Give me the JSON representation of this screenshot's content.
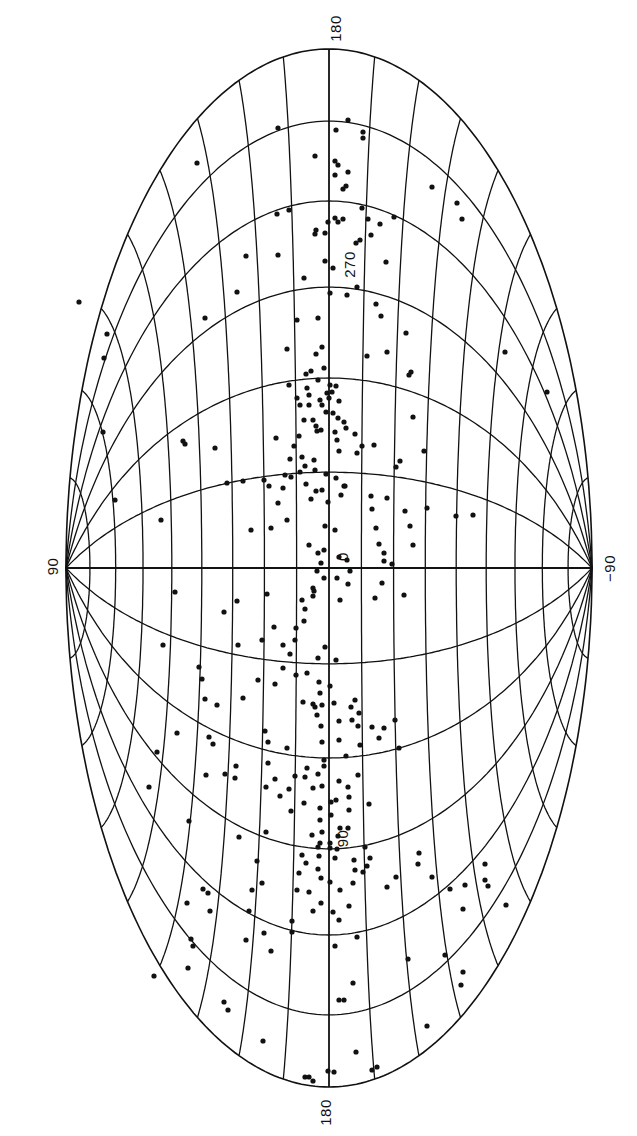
{
  "chart_data": {
    "type": "scatter",
    "title": "",
    "projection": "Hammer-Aitoff equal-area (galactic coordinates), rotated 90 degrees",
    "xlabel": "galactic latitude (horizontal: +90 at left pole, -90 at right pole)",
    "ylabel": "galactic longitude (vertical: 180 top, 270, 0 centre, 90, 180 bottom)",
    "grid": true,
    "grid_spacing": {
      "longitude_deg": 30,
      "latitude_deg": 10
    },
    "labels": {
      "top": "180",
      "bottom": "180",
      "left_pole": "90",
      "right_pole": "−90",
      "center": "0",
      "upper_meridian": "270",
      "lower_meridian": "90"
    },
    "geometry": {
      "cx": 329,
      "cy": 568,
      "half_width": 263,
      "half_height": 519
    },
    "points_screen_px": [
      [
        348,
        120
      ],
      [
        336,
        130
      ],
      [
        338,
        165
      ],
      [
        335,
        175
      ],
      [
        348,
        172
      ],
      [
        315,
        156
      ],
      [
        278,
        128
      ],
      [
        197,
        163
      ],
      [
        277,
        214
      ],
      [
        289,
        210
      ],
      [
        278,
        255
      ],
      [
        246,
        256
      ],
      [
        237,
        292
      ],
      [
        205,
        318
      ],
      [
        107,
        334
      ],
      [
        79,
        302
      ],
      [
        104,
        358
      ],
      [
        103,
        432
      ],
      [
        115,
        500
      ],
      [
        346,
        186
      ],
      [
        363,
        138
      ],
      [
        363,
        132
      ],
      [
        335,
        161
      ],
      [
        343,
        189
      ],
      [
        338,
        222
      ],
      [
        343,
        219
      ],
      [
        328,
        222
      ],
      [
        315,
        234
      ],
      [
        325,
        233
      ],
      [
        325,
        261
      ],
      [
        335,
        218
      ],
      [
        304,
        278
      ],
      [
        297,
        320
      ],
      [
        322,
        347
      ],
      [
        333,
        268
      ],
      [
        330,
        293
      ],
      [
        316,
        230
      ],
      [
        318,
        318
      ],
      [
        347,
        295
      ],
      [
        356,
        243
      ],
      [
        357,
        287
      ],
      [
        376,
        304
      ],
      [
        386,
        262
      ],
      [
        394,
        217
      ],
      [
        432,
        187
      ],
      [
        362,
        208
      ],
      [
        368,
        219
      ],
      [
        380,
        224
      ],
      [
        360,
        240
      ],
      [
        371,
        235
      ],
      [
        381,
        316
      ],
      [
        406,
        333
      ],
      [
        367,
        356
      ],
      [
        387,
        352
      ],
      [
        409,
        375
      ],
      [
        457,
        203
      ],
      [
        462,
        219
      ],
      [
        505,
        352
      ],
      [
        547,
        392
      ],
      [
        330,
        385
      ],
      [
        327,
        393
      ],
      [
        311,
        371
      ],
      [
        316,
        354
      ],
      [
        306,
        374
      ],
      [
        287,
        349
      ],
      [
        289,
        385
      ],
      [
        313,
        420
      ],
      [
        321,
        430
      ],
      [
        316,
        426
      ],
      [
        304,
        420
      ],
      [
        309,
        405
      ],
      [
        309,
        395
      ],
      [
        307,
        388
      ],
      [
        318,
        380
      ],
      [
        320,
        400
      ],
      [
        322,
        405
      ],
      [
        326,
        412
      ],
      [
        329,
        398
      ],
      [
        332,
        392
      ],
      [
        336,
        386
      ],
      [
        339,
        401
      ],
      [
        333,
        413
      ],
      [
        338,
        418
      ],
      [
        344,
        422
      ],
      [
        300,
        405
      ],
      [
        297,
        398
      ],
      [
        324,
        368
      ],
      [
        317,
        431
      ],
      [
        335,
        432
      ],
      [
        346,
        428
      ],
      [
        337,
        440
      ],
      [
        339,
        451
      ],
      [
        355,
        434
      ],
      [
        357,
        453
      ],
      [
        362,
        446
      ],
      [
        374,
        445
      ],
      [
        299,
        436
      ],
      [
        294,
        446
      ],
      [
        302,
        457
      ],
      [
        290,
        459
      ],
      [
        305,
        466
      ],
      [
        314,
        460
      ],
      [
        315,
        470
      ],
      [
        300,
        472
      ],
      [
        291,
        477
      ],
      [
        285,
        475
      ],
      [
        283,
        488
      ],
      [
        306,
        484
      ],
      [
        326,
        474
      ],
      [
        336,
        478
      ],
      [
        344,
        486
      ],
      [
        322,
        490
      ],
      [
        328,
        502
      ],
      [
        276,
        438
      ],
      [
        278,
        503
      ],
      [
        287,
        520
      ],
      [
        311,
        499
      ],
      [
        316,
        491
      ],
      [
        345,
        486
      ],
      [
        341,
        495
      ],
      [
        335,
        530
      ],
      [
        321,
        563
      ],
      [
        324,
        550
      ],
      [
        269,
        486
      ],
      [
        264,
        480
      ],
      [
        271,
        528
      ],
      [
        251,
        530
      ],
      [
        243,
        481
      ],
      [
        227,
        483
      ],
      [
        161,
        520
      ],
      [
        215,
        448
      ],
      [
        185,
        444
      ],
      [
        183,
        441
      ],
      [
        325,
        526
      ],
      [
        309,
        545
      ],
      [
        318,
        553
      ],
      [
        339,
        557
      ],
      [
        347,
        560
      ],
      [
        317,
        571
      ],
      [
        324,
        578
      ],
      [
        313,
        588
      ],
      [
        337,
        578
      ],
      [
        348,
        584
      ],
      [
        340,
        600
      ],
      [
        350,
        571
      ],
      [
        379,
        544
      ],
      [
        376,
        528
      ],
      [
        372,
        509
      ],
      [
        405,
        511
      ],
      [
        410,
        526
      ],
      [
        387,
        498
      ],
      [
        371,
        496
      ],
      [
        396,
        467
      ],
      [
        400,
        461
      ],
      [
        424,
        451
      ],
      [
        384,
        553
      ],
      [
        384,
        561
      ],
      [
        392,
        564
      ],
      [
        413,
        545
      ],
      [
        375,
        598
      ],
      [
        382,
        583
      ],
      [
        404,
        595
      ],
      [
        411,
        372
      ],
      [
        413,
        417
      ],
      [
        473,
        515
      ],
      [
        427,
        508
      ],
      [
        456,
        516
      ],
      [
        302,
        600
      ],
      [
        305,
        609
      ],
      [
        304,
        621
      ],
      [
        296,
        628
      ],
      [
        295,
        640
      ],
      [
        283,
        645
      ],
      [
        290,
        654
      ],
      [
        283,
        668
      ],
      [
        296,
        675
      ],
      [
        307,
        673
      ],
      [
        318,
        658
      ],
      [
        325,
        647
      ],
      [
        336,
        660
      ],
      [
        319,
        682
      ],
      [
        330,
        686
      ],
      [
        322,
        705
      ],
      [
        313,
        596
      ],
      [
        314,
        591
      ],
      [
        274,
        627
      ],
      [
        262,
        640
      ],
      [
        238,
        645
      ],
      [
        237,
        601
      ],
      [
        224,
        612
      ],
      [
        175,
        592
      ],
      [
        267,
        594
      ],
      [
        275,
        684
      ],
      [
        258,
        680
      ],
      [
        243,
        698
      ],
      [
        217,
        705
      ],
      [
        205,
        699
      ],
      [
        202,
        679
      ],
      [
        199,
        667
      ],
      [
        163,
        645
      ],
      [
        209,
        737
      ],
      [
        213,
        744
      ],
      [
        320,
        693
      ],
      [
        313,
        704
      ],
      [
        303,
        702
      ],
      [
        315,
        707
      ],
      [
        334,
        703
      ],
      [
        317,
        715
      ],
      [
        321,
        726
      ],
      [
        339,
        721
      ],
      [
        352,
        720
      ],
      [
        351,
        707
      ],
      [
        355,
        700
      ],
      [
        359,
        713
      ],
      [
        358,
        726
      ],
      [
        339,
        740
      ],
      [
        322,
        742
      ],
      [
        324,
        760
      ],
      [
        346,
        756
      ],
      [
        360,
        745
      ],
      [
        379,
        738
      ],
      [
        372,
        727
      ],
      [
        395,
        720
      ],
      [
        399,
        748
      ],
      [
        384,
        728
      ],
      [
        287,
        748
      ],
      [
        268,
        742
      ],
      [
        265,
        731
      ],
      [
        268,
        763
      ],
      [
        275,
        779
      ],
      [
        295,
        776
      ],
      [
        305,
        777
      ],
      [
        313,
        788
      ],
      [
        322,
        786
      ],
      [
        304,
        803
      ],
      [
        320,
        808
      ],
      [
        320,
        820
      ],
      [
        322,
        832
      ],
      [
        312,
        835
      ],
      [
        320,
        843
      ],
      [
        330,
        843
      ],
      [
        335,
        858
      ],
      [
        318,
        774
      ],
      [
        307,
        768
      ],
      [
        324,
        766
      ],
      [
        339,
        781
      ],
      [
        348,
        787
      ],
      [
        358,
        775
      ],
      [
        349,
        797
      ],
      [
        336,
        800
      ],
      [
        331,
        802
      ],
      [
        349,
        810
      ],
      [
        331,
        815
      ],
      [
        340,
        828
      ],
      [
        338,
        836
      ],
      [
        348,
        828
      ],
      [
        337,
        849
      ],
      [
        354,
        860
      ],
      [
        367,
        866
      ],
      [
        365,
        847
      ],
      [
        369,
        804
      ],
      [
        289,
        789
      ],
      [
        291,
        811
      ],
      [
        280,
        796
      ],
      [
        266,
        787
      ],
      [
        266,
        832
      ],
      [
        257,
        861
      ],
      [
        302,
        855
      ],
      [
        306,
        863
      ],
      [
        297,
        890
      ],
      [
        299,
        873
      ],
      [
        318,
        847
      ],
      [
        319,
        856
      ],
      [
        330,
        848
      ],
      [
        318,
        869
      ],
      [
        321,
        878
      ],
      [
        330,
        882
      ],
      [
        309,
        892
      ],
      [
        321,
        903
      ],
      [
        313,
        911
      ],
      [
        333,
        912
      ],
      [
        339,
        920
      ],
      [
        349,
        906
      ],
      [
        340,
        890
      ],
      [
        353,
        883
      ],
      [
        355,
        870
      ],
      [
        370,
        858
      ],
      [
        357,
        937
      ],
      [
        335,
        946
      ],
      [
        353,
        983
      ],
      [
        339,
        1000
      ],
      [
        344,
        1000
      ],
      [
        363,
        872
      ],
      [
        396,
        877
      ],
      [
        387,
        887
      ],
      [
        418,
        864
      ],
      [
        419,
        853
      ],
      [
        432,
        877
      ],
      [
        450,
        889
      ],
      [
        465,
        885
      ],
      [
        485,
        864
      ],
      [
        485,
        880
      ],
      [
        488,
        886
      ],
      [
        463,
        909
      ],
      [
        506,
        905
      ],
      [
        463,
        972
      ],
      [
        461,
        985
      ],
      [
        445,
        955
      ],
      [
        408,
        959
      ],
      [
        427,
        1026
      ],
      [
        356,
        1052
      ],
      [
        334,
        1072
      ],
      [
        328,
        1071
      ],
      [
        313,
        1081
      ],
      [
        309,
        1077
      ],
      [
        305,
        1077
      ],
      [
        377,
        1067
      ],
      [
        372,
        1070
      ],
      [
        263,
        1041
      ],
      [
        228,
        1010
      ],
      [
        224,
        1002
      ],
      [
        271,
        951
      ],
      [
        292,
        932
      ],
      [
        264,
        933
      ],
      [
        193,
        946
      ],
      [
        191,
        939
      ],
      [
        154,
        976
      ],
      [
        188,
        968
      ],
      [
        210,
        911
      ],
      [
        208,
        893
      ],
      [
        203,
        889
      ],
      [
        187,
        903
      ],
      [
        189,
        821
      ],
      [
        149,
        787
      ],
      [
        157,
        752
      ],
      [
        177,
        733
      ],
      [
        225,
        774
      ],
      [
        206,
        775
      ],
      [
        236,
        766
      ],
      [
        235,
        778
      ],
      [
        239,
        837
      ],
      [
        262,
        883
      ],
      [
        252,
        890
      ],
      [
        246,
        940
      ],
      [
        249,
        911
      ],
      [
        292,
        921
      ]
    ]
  },
  "colors": {
    "background": "#ffffff",
    "ink": "#111111"
  }
}
